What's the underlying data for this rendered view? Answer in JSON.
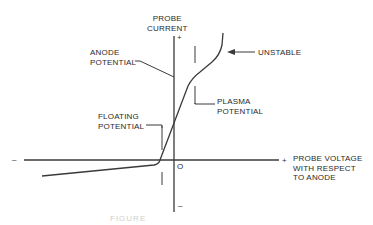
{
  "diagram": {
    "y_axis": {
      "label_line1": "PROBE",
      "label_line2": "CURRENT",
      "positive_sign": "+",
      "negative_sign": "–"
    },
    "x_axis": {
      "label_line1": "PROBE VOLTAGE",
      "label_line2": "WITH RESPECT",
      "label_line3": "TO ANODE",
      "positive_sign": "+",
      "negative_sign": "–"
    },
    "origin_label": "O",
    "annotations": {
      "anode_line1": "ANODE",
      "anode_line2": "POTENTIAL",
      "floating_line1": "FLOATING",
      "floating_line2": "POTENTIAL",
      "plasma_line1": "PLASMA",
      "plasma_line2": "POTENTIAL",
      "unstable": "UNSTABLE"
    },
    "caption": "FIGURE",
    "colors": {
      "line": "#3a3a3a",
      "text": "#2a2a2a",
      "background": "#ffffff"
    }
  }
}
